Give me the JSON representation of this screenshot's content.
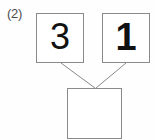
{
  "worksheet": {
    "problem_label": "(2)",
    "type": "number-bond",
    "operation": "addition"
  },
  "number_bond": {
    "addend_1": "3",
    "addend_2": "1",
    "sum": "",
    "sum_is_blank": true
  },
  "boxes": [
    {
      "name": "addend-1",
      "value": "3",
      "x": 36,
      "y": 13,
      "width": 48,
      "height": 50
    },
    {
      "name": "addend-2",
      "value": "1",
      "x": 102,
      "y": 13,
      "width": 48,
      "height": 50
    },
    {
      "name": "sum",
      "value": "",
      "x": 67,
      "y": 88,
      "width": 55,
      "height": 51
    }
  ],
  "connectors": [
    {
      "name": "left-connector",
      "from_x": 61,
      "from_y": 63,
      "to_x": 95,
      "to_y": 88
    },
    {
      "name": "right-connector",
      "from_x": 126,
      "from_y": 63,
      "to_x": 96,
      "to_y": 88
    }
  ],
  "colors": {
    "background": "#fefefe",
    "box_border": "#8a8a8a",
    "digit": "#111111",
    "label": "#4d4d4d",
    "connector": "#8a8a8a"
  }
}
